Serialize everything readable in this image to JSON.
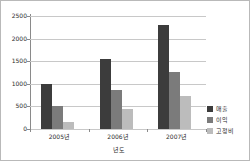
{
  "chart_data": {
    "type": "bar",
    "title": "",
    "subtitle": "",
    "xlabel": "년도",
    "ylabel": "",
    "categories": [
      "2005년",
      "2006년",
      "2007년"
    ],
    "series": [
      {
        "name": "매출",
        "color": "#3c3c3c",
        "values": [
          1000,
          1550,
          2300
        ]
      },
      {
        "name": "이익",
        "color": "#7b7b7b",
        "values": [
          500,
          860,
          1270
        ]
      },
      {
        "name": "고정비",
        "color": "#bcbcbc",
        "values": [
          150,
          440,
          720
        ]
      }
    ],
    "ylim": [
      0,
      2500
    ],
    "yticks": [
      0,
      500,
      1000,
      1500,
      2000,
      2500
    ],
    "ytick_labels": [
      "0",
      "500",
      "1000",
      "1500",
      "2000",
      "2500"
    ],
    "grid": true,
    "grid_axis": "y",
    "legend_position": "right",
    "frame": true,
    "background_color": "#ffffff",
    "border_color": "#b9b9b9"
  }
}
